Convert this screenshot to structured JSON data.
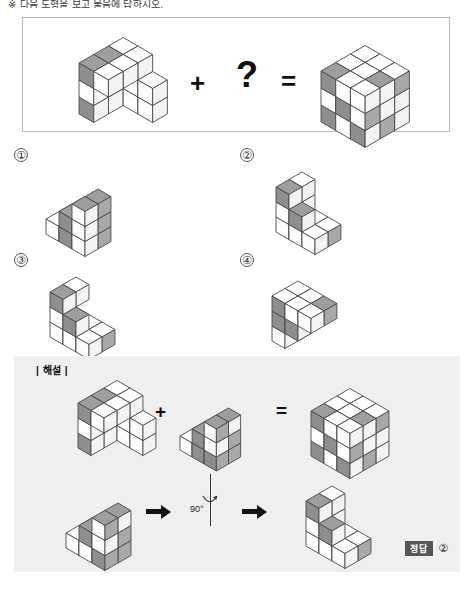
{
  "header": {
    "clipped_text": "※ 다음 도형을 보고 물음에 답하시오."
  },
  "question": {
    "operator_plus": "+",
    "unknown": "?",
    "operator_equals": "=",
    "shape_left_name": "L-shaped-block-assembly",
    "shape_result_name": "completed-3x3x3-cube"
  },
  "options": [
    {
      "number": "①",
      "name": "option-1-shape"
    },
    {
      "number": "②",
      "name": "option-2-shape"
    },
    {
      "number": "③",
      "name": "option-3-shape"
    },
    {
      "number": "④",
      "name": "option-4-shape"
    }
  ],
  "explanation": {
    "label": "| 해설 |",
    "operator_plus": "+",
    "operator_equals": "=",
    "rotation_degrees": "90°",
    "arrow": "→",
    "answer_tag": "정답",
    "answer_value": "②"
  },
  "colors": {
    "gray_face": "#9a9a9a",
    "white_face": "#ffffff",
    "stroke": "#4a4a4a",
    "panel_bg": "#efefef",
    "box_border": "#b8b8b8",
    "badge_bg": "#555555"
  },
  "chart_data": {
    "type": "table",
    "result_cube_front_face": [
      [
        "gray",
        "white",
        "white"
      ],
      [
        "white",
        "gray",
        "white"
      ],
      [
        "gray",
        "white",
        "gray"
      ]
    ],
    "result_cube_top_face": [
      [
        "gray",
        "white",
        "white"
      ],
      [
        "white",
        "white",
        "gray"
      ],
      [
        "white",
        "white",
        "white"
      ]
    ],
    "result_cube_right_face": [
      [
        "white",
        "white",
        "gray"
      ],
      [
        "gray",
        "white",
        "white"
      ],
      [
        "white",
        "gray",
        "white"
      ]
    ]
  }
}
